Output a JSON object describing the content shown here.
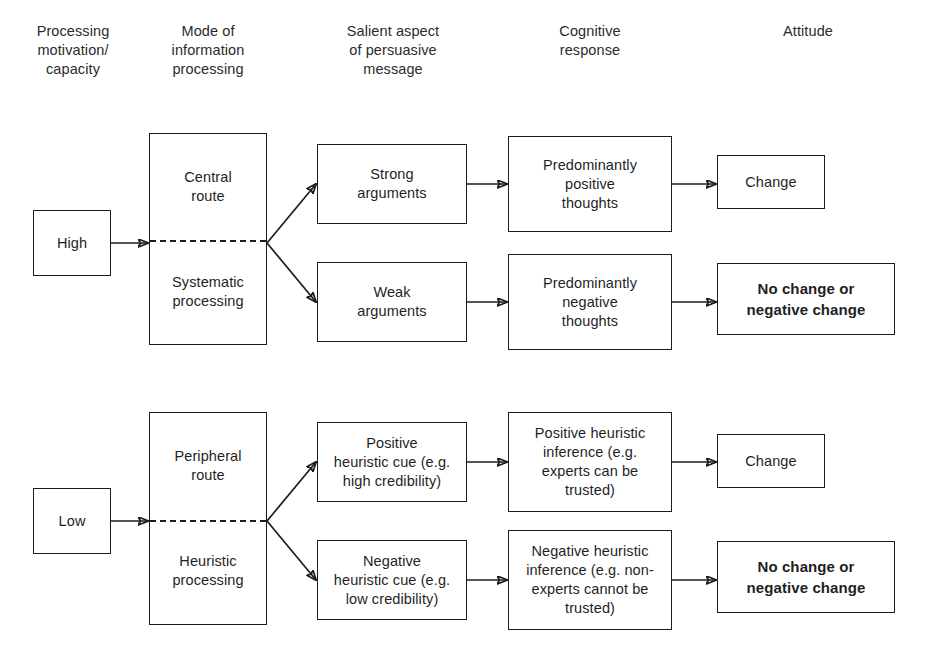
{
  "figure": {
    "type": "flowchart"
  },
  "columns": [
    {
      "id": "processing-motivation",
      "label": "Processing\nmotivation/\ncapacity"
    },
    {
      "id": "mode-of-processing",
      "label": "Mode of\ninformation\nprocessing"
    },
    {
      "id": "salient-aspect",
      "label": "Salient aspect\nof persuasive\nmessage"
    },
    {
      "id": "cognitive-response",
      "label": "Cognitive\nresponse"
    },
    {
      "id": "attitude",
      "label": "Attitude"
    }
  ],
  "upper_path": {
    "motivation": "High",
    "route_top": "Central\nroute",
    "route_bottom": "Systematic\nprocessing",
    "branches": [
      {
        "salient": "Strong\narguments",
        "cognitive": "Predominantly\npositive\nthoughts",
        "attitude": "Change",
        "attitude_emphasis": "normal"
      },
      {
        "salient": "Weak\narguments",
        "cognitive": "Predominantly\nnegative\nthoughts",
        "attitude": "No change or\nnegative change",
        "attitude_emphasis": "bold"
      }
    ]
  },
  "lower_path": {
    "motivation": "Low",
    "route_top": "Peripheral\nroute",
    "route_bottom": "Heuristic\nprocessing",
    "branches": [
      {
        "salient": "Positive\nheuristic cue (e.g.\nhigh credibility)",
        "cognitive": "Positive heuristic\ninference (e.g.\nexperts can be\ntrusted)",
        "attitude": "Change",
        "attitude_emphasis": "normal"
      },
      {
        "salient": "Negative\nheuristic cue (e.g.\nlow credibility)",
        "cognitive": "Negative heuristic\ninference (e.g. non-\nexperts cannot be\ntrusted)",
        "attitude": "No change or\nnegative change",
        "attitude_emphasis": "bold"
      }
    ]
  },
  "colors": {
    "stroke": "#1c1c1c",
    "text": "#1f1f1f",
    "background": "#ffffff"
  }
}
